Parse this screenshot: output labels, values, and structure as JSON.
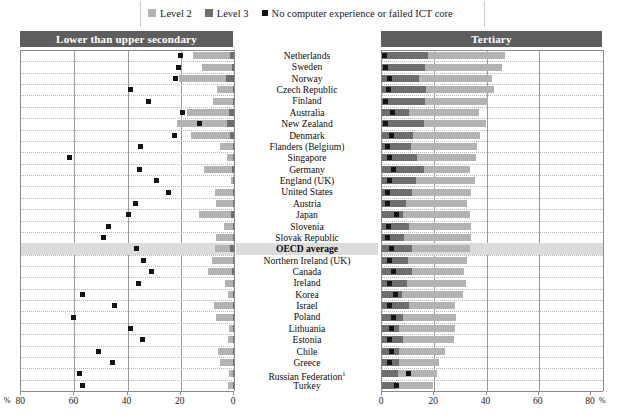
{
  "legend": {
    "items": [
      {
        "label": "Level 2",
        "icon": "square-swatch-level2",
        "color": "#b3b3b3"
      },
      {
        "label": "Level 3",
        "icon": "square-swatch-level3",
        "color": "#6e6e6e"
      },
      {
        "label": "No computer experience or failed ICT core",
        "icon": "square-swatch-no-computer",
        "color": "#141414"
      }
    ]
  },
  "panels": {
    "left": {
      "title": "Lower than upper secondary"
    },
    "right": {
      "title": "Tertiary"
    }
  },
  "axis": {
    "left": {
      "ticks": [
        "80",
        "60",
        "40",
        "20",
        "0"
      ],
      "unit": "%",
      "unit_side": "left",
      "min": 0,
      "max": 80,
      "reversed": true
    },
    "right": {
      "ticks": [
        "0",
        "20",
        "40",
        "60",
        "80"
      ],
      "unit": "%",
      "unit_side": "right",
      "min": 0,
      "max": 80,
      "reversed": false
    }
  },
  "chart_data": {
    "type": "bar",
    "xlabel": "%",
    "ylabel": "",
    "xlim": [
      0,
      80
    ],
    "grid": true,
    "legend_position": "top",
    "orientation": "horizontal-diverging",
    "series": [
      {
        "name": "Level 2",
        "color": "#b3b3b3"
      },
      {
        "name": "Level 3",
        "color": "#6e6e6e"
      },
      {
        "name": "No computer experience or failed ICT core",
        "color": "#141414",
        "marker": "square"
      }
    ],
    "categories": [
      "Netherlands",
      "Sweden",
      "Norway",
      "Czech Republic",
      "Finland",
      "Australia",
      "New Zealand",
      "Denmark",
      "Flanders (Belgium)",
      "Singapore",
      "Germany",
      "England (UK)",
      "United States",
      "Austria",
      "Japan",
      "Slovenia",
      "Slovak Republic",
      "OECD average",
      "Northern Ireland (UK)",
      "Canada",
      "Ireland",
      "Korea",
      "Israel",
      "Poland",
      "Lithuania",
      "Estonia",
      "Chile",
      "Greece",
      "Russian Federation",
      "Turkey"
    ],
    "highlight_category": "OECD average",
    "footnote_markers": {
      "Russian Federation": "1"
    },
    "panels": [
      {
        "panel": "Lower than upper secondary",
        "level2": [
          14.0,
          11.5,
          17.5,
          6.0,
          7.5,
          15.5,
          19.0,
          14.5,
          5.0,
          2.5,
          10.5,
          1.0,
          7.0,
          6.5,
          12.0,
          3.5,
          6.5,
          5.5,
          8.0,
          9.0,
          3.0,
          2.0,
          7.0,
          6.5,
          1.5,
          2.0,
          5.5,
          5.0,
          1.5,
          2.0
        ],
        "level3": [
          1.5,
          0.6,
          3.0,
          0.3,
          0.4,
          2.0,
          2.5,
          1.5,
          0.3,
          0.2,
          0.8,
          0.2,
          0.3,
          0.2,
          1.2,
          0.2,
          0.3,
          1.5,
          0.4,
          0.8,
          0.2,
          0.2,
          0.5,
          0.4,
          0.2,
          0.2,
          0.4,
          0.3,
          0.2,
          0.2
        ],
        "no_computer": [
          20.0,
          21.0,
          22.0,
          39.0,
          32.0,
          19.5,
          13.0,
          22.5,
          35.0,
          62.0,
          35.5,
          29.0,
          24.5,
          37.0,
          39.5,
          47.0,
          49.0,
          36.5,
          34.0,
          31.0,
          36.0,
          57.0,
          45.0,
          60.5,
          39.0,
          34.5,
          51.0,
          45.5,
          58.0,
          57.0
        ]
      },
      {
        "panel": "Tertiary",
        "level2": [
          47.0,
          46.0,
          42.0,
          43.0,
          40.5,
          37.0,
          40.0,
          37.5,
          36.5,
          36.0,
          33.5,
          35.5,
          34.0,
          32.5,
          33.5,
          34.0,
          34.0,
          33.5,
          32.5,
          31.5,
          32.0,
          31.0,
          28.0,
          28.5,
          28.0,
          27.5,
          24.0,
          22.0,
          21.0,
          19.5
        ],
        "level3": [
          17.5,
          16.5,
          14.0,
          17.0,
          16.5,
          10.5,
          16.0,
          12.0,
          11.0,
          13.5,
          16.0,
          13.0,
          11.5,
          9.0,
          8.0,
          10.5,
          8.5,
          11.5,
          10.0,
          11.5,
          9.5,
          7.5,
          10.5,
          8.0,
          6.5,
          8.0,
          6.5,
          6.5,
          6.0,
          5.5
        ],
        "no_computer": [
          1.0,
          1.5,
          3.0,
          2.5,
          1.5,
          4.0,
          1.5,
          3.5,
          2.0,
          3.0,
          4.5,
          3.0,
          2.0,
          2.0,
          5.5,
          2.5,
          2.0,
          3.5,
          3.0,
          4.5,
          3.0,
          5.0,
          3.0,
          4.5,
          3.5,
          3.0,
          3.5,
          3.0,
          10.0,
          5.5
        ]
      }
    ]
  }
}
